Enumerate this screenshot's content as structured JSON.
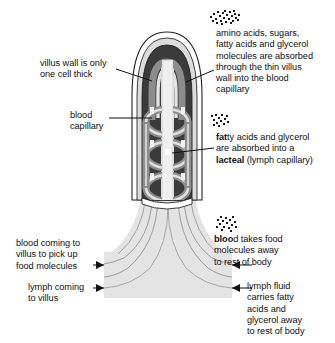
{
  "figure": {
    "subject": "villus",
    "colors": {
      "outline": "#1a1a1a",
      "wall_white": "#ffffff",
      "wall_light_gray": "#d9d9d9",
      "interior_dark": "#3a3a3a",
      "capillary_gray": "#8a8a8a",
      "lacteal_light": "#e8e8e8",
      "base_band": "#e3e3e3",
      "text": "#111111"
    }
  },
  "labels": {
    "villus_wall": {
      "text": "villus wall is only\none cell thick",
      "name": "villus-wall-label"
    },
    "blood_capillary": {
      "text": "blood\ncapillary",
      "name": "blood-capillary-label"
    },
    "absorption": {
      "text": "amino acids, sugars,\nfatty acids and glycerol\nmolecules are absorbed\nthrough the thin villus\nwall into the blood\ncapillary",
      "name": "absorption-label"
    },
    "lacteal": {
      "line1_bold": "fat",
      "line1_rest": "ty acids and glycerol",
      "line2": "are absorbed into a",
      "line3_bold": "lacteal",
      "line3_rest": " (lymph capillary)",
      "name": "lacteal-label"
    },
    "blood_in": {
      "text": "blood coming to\nvillus to pick up\nfood molecules",
      "name": "blood-incoming-label"
    },
    "lymph_in": {
      "text": "lymph coming\nto villus",
      "name": "lymph-incoming-label"
    },
    "blood_out": {
      "line1_bold": "bloo",
      "line1_rest": "d takes food",
      "line2": "molecules away",
      "line3": "to rest of body",
      "name": "blood-outgoing-label"
    },
    "lymph_out": {
      "text": "lymph fluid\ncarries fatty\nacids and\nglycerol away\nto rest of body",
      "name": "lymph-outgoing-label"
    }
  },
  "icons": {
    "molecules_top": "molecule-stipple-icon",
    "molecules_mid": "molecule-stipple-icon",
    "molecules_bottom": "molecule-stipple-icon"
  }
}
